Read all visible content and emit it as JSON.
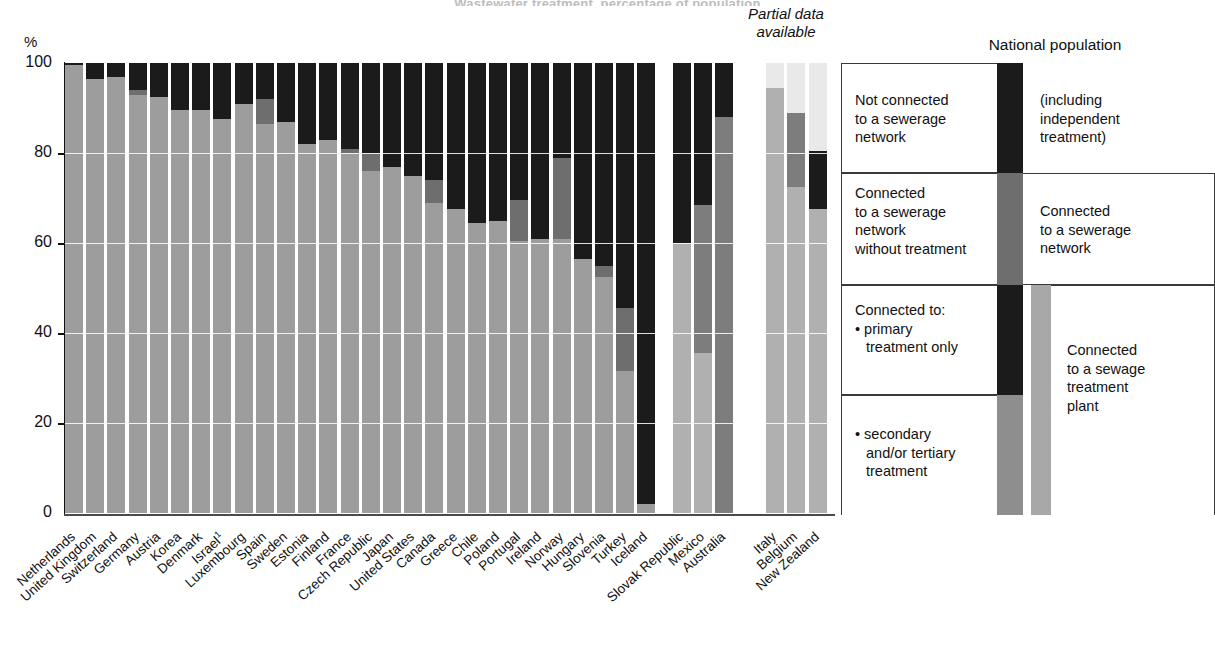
{
  "title": "Wastewater treatment, percentage of population",
  "axis": {
    "y_unit": "%",
    "y_ticks": [
      "100",
      "80",
      "60",
      "40",
      "20",
      "0"
    ],
    "ylim": [
      0,
      100
    ]
  },
  "annotations": {
    "partial_data": "Partial data\navailable",
    "partial_data_line1": "Partial data",
    "partial_data_line2": "available",
    "national_population": "National population"
  },
  "legend": {
    "not_connected": "Not connected\nto a sewerage\nnetwork",
    "not_connected_l1": "Not connected",
    "not_connected_l2": "to a sewerage",
    "not_connected_l3": "network",
    "including_independent": "(including\nindependent\ntreatment)",
    "including_l1": "(including",
    "including_l2": "independent",
    "including_l3": "treatment)",
    "connected_no_treatment_l1": "Connected",
    "connected_no_treatment_l2": "to a sewerage",
    "connected_no_treatment_l3": "network",
    "connected_no_treatment_l4": "without treatment",
    "connected_sewerage_l1": "Connected",
    "connected_sewerage_l2": "to a sewerage",
    "connected_sewerage_l3": "network",
    "connected_to_l1": "Connected to:",
    "primary_l1": "• primary",
    "primary_l2": "treatment only",
    "secondary_l1": "• secondary",
    "secondary_l2": "and/or tertiary",
    "secondary_l3": "treatment",
    "sewage_plant_l1": "Connected",
    "sewage_plant_l2": "to a sewage",
    "sewage_plant_l3": "treatment",
    "sewage_plant_l4": "plant"
  },
  "colors": {
    "secondary_tertiary": "#9d9d9d",
    "primary_only": "#6e6e6e",
    "no_treatment": "#1b1b1b",
    "not_connected": "#1b1b1b",
    "partial_unknown": "#e9e9e9",
    "background": "#ffffff",
    "axis": "#111111"
  },
  "chart_data": {
    "type": "bar",
    "stacked": true,
    "title": "Wastewater treatment, percentage of population",
    "xlabel": "",
    "ylabel": "%",
    "ylim": [
      0,
      100
    ],
    "grid": true,
    "legend_position": "right",
    "series": [
      {
        "name": "secondary and/or tertiary treatment",
        "color": "#9d9d9d"
      },
      {
        "name": "primary treatment only",
        "color": "#6e6e6e"
      },
      {
        "name": "connected to a sewerage network without treatment",
        "color": "#1b1b1b"
      },
      {
        "name": "not connected to a sewerage network",
        "color": "#1b1b1b"
      },
      {
        "name": "no data (partial)",
        "color": "#e9e9e9"
      }
    ],
    "categories": [
      "Netherlands",
      "United Kingdom",
      "Switzerland",
      "Germany",
      "Austria",
      "Korea",
      "Denmark",
      "Israel",
      "Luxembourg",
      "Spain",
      "Sweden",
      "Estonia",
      "Finland",
      "France",
      "Czech Republic",
      "Japan",
      "United States",
      "Canada",
      "Greece",
      "Chile",
      "Poland",
      "Portugal",
      "Ireland",
      "Norway",
      "Hungary",
      "Slovenia",
      "Turkey",
      "Iceland",
      "Slovak Republic",
      "Mexico",
      "Australia",
      "Italy",
      "Belgium",
      "New Zealand"
    ],
    "partial_data_categories": [
      "Slovak Republic",
      "Mexico",
      "Australia",
      "Italy",
      "Belgium",
      "New Zealand"
    ],
    "bars": [
      {
        "label": "Netherlands",
        "partial": false,
        "secondary": 99.5,
        "primary": 0,
        "no_treatment": 0.5,
        "not_connected": 0,
        "unknown": 0
      },
      {
        "label": "United Kingdom",
        "partial": false,
        "secondary": 96.5,
        "primary": 0,
        "no_treatment": 0,
        "not_connected": 3.5,
        "unknown": 0
      },
      {
        "label": "Switzerland",
        "partial": false,
        "secondary": 97,
        "primary": 0,
        "no_treatment": 0,
        "not_connected": 3,
        "unknown": 0
      },
      {
        "label": "Germany",
        "partial": false,
        "secondary": 93,
        "primary": 1,
        "no_treatment": 0,
        "not_connected": 6,
        "unknown": 0
      },
      {
        "label": "Austria",
        "partial": false,
        "secondary": 92.5,
        "primary": 0,
        "no_treatment": 0,
        "not_connected": 7.5,
        "unknown": 0
      },
      {
        "label": "Korea",
        "partial": false,
        "secondary": 89.5,
        "primary": 0,
        "no_treatment": 0,
        "not_connected": 10.5,
        "unknown": 0
      },
      {
        "label": "Denmark",
        "partial": false,
        "secondary": 89.5,
        "primary": 0,
        "no_treatment": 0,
        "not_connected": 10.5,
        "unknown": 0
      },
      {
        "label": "Israel",
        "partial": false,
        "secondary": 87.5,
        "primary": 0,
        "no_treatment": 5.5,
        "not_connected": 7,
        "unknown": 0
      },
      {
        "label": "Luxembourg",
        "partial": false,
        "secondary": 91,
        "primary": 0,
        "no_treatment": 0,
        "not_connected": 9,
        "unknown": 0
      },
      {
        "label": "Spain",
        "partial": false,
        "secondary": 86.5,
        "primary": 5.5,
        "no_treatment": 0,
        "not_connected": 8,
        "unknown": 0
      },
      {
        "label": "Sweden",
        "partial": false,
        "secondary": 87,
        "primary": 0,
        "no_treatment": 0,
        "not_connected": 13,
        "unknown": 0
      },
      {
        "label": "Estonia",
        "partial": false,
        "secondary": 82,
        "primary": 0,
        "no_treatment": 0,
        "not_connected": 18,
        "unknown": 0
      },
      {
        "label": "Finland",
        "partial": false,
        "secondary": 83,
        "primary": 0,
        "no_treatment": 0,
        "not_connected": 17,
        "unknown": 0
      },
      {
        "label": "France",
        "partial": false,
        "secondary": 80,
        "primary": 1,
        "no_treatment": 1,
        "not_connected": 18,
        "unknown": 0
      },
      {
        "label": "Czech Republic",
        "partial": false,
        "secondary": 76,
        "primary": 4,
        "no_treatment": 0,
        "not_connected": 20,
        "unknown": 0
      },
      {
        "label": "Japan",
        "partial": false,
        "secondary": 77,
        "primary": 0,
        "no_treatment": 0,
        "not_connected": 23,
        "unknown": 0
      },
      {
        "label": "United States",
        "partial": false,
        "secondary": 75,
        "primary": 0,
        "no_treatment": 0,
        "not_connected": 25,
        "unknown": 0
      },
      {
        "label": "Canada",
        "partial": false,
        "secondary": 69,
        "primary": 5,
        "no_treatment": 2,
        "not_connected": 24,
        "unknown": 0
      },
      {
        "label": "Greece",
        "partial": false,
        "secondary": 67.5,
        "primary": 0,
        "no_treatment": 0,
        "not_connected": 32.5,
        "unknown": 0
      },
      {
        "label": "Chile",
        "partial": false,
        "secondary": 64.5,
        "primary": 0,
        "no_treatment": 19,
        "not_connected": 16.5,
        "unknown": 0
      },
      {
        "label": "Poland",
        "partial": false,
        "secondary": 65,
        "primary": 0,
        "no_treatment": 0,
        "not_connected": 35,
        "unknown": 0
      },
      {
        "label": "Portugal",
        "partial": false,
        "secondary": 60.5,
        "primary": 9,
        "no_treatment": 1.5,
        "not_connected": 29,
        "unknown": 0
      },
      {
        "label": "Ireland",
        "partial": false,
        "secondary": 61,
        "primary": 0,
        "no_treatment": 13,
        "not_connected": 26,
        "unknown": 0
      },
      {
        "label": "Norway",
        "partial": false,
        "secondary": 61,
        "primary": 18,
        "no_treatment": 0,
        "not_connected": 21,
        "unknown": 0
      },
      {
        "label": "Hungary",
        "partial": false,
        "secondary": 56.5,
        "primary": 0,
        "no_treatment": 15,
        "not_connected": 28.5,
        "unknown": 0
      },
      {
        "label": "Slovenia",
        "partial": false,
        "secondary": 52.5,
        "primary": 2.5,
        "no_treatment": 11,
        "not_connected": 34,
        "unknown": 0
      },
      {
        "label": "Turkey",
        "partial": false,
        "secondary": 31.5,
        "primary": 14,
        "no_treatment": 0,
        "not_connected": 54.5,
        "unknown": 0
      },
      {
        "label": "Iceland",
        "partial": false,
        "secondary": 2,
        "primary": 0,
        "no_treatment": 55,
        "not_connected": 43,
        "unknown": 0
      },
      {
        "label": "Slovak Republic",
        "partial": true,
        "secondary": 60,
        "primary": 0,
        "no_treatment": 0,
        "not_connected": 40,
        "unknown": 0
      },
      {
        "label": "Mexico",
        "partial": true,
        "secondary": 35.5,
        "primary": 33,
        "no_treatment": 0,
        "not_connected": 31.5,
        "unknown": 0
      },
      {
        "label": "Australia",
        "partial": true,
        "secondary": 0,
        "primary": 88,
        "no_treatment": 0,
        "not_connected": 12,
        "unknown": 0
      },
      {
        "label": "Italy",
        "partial": true,
        "secondary": 94.5,
        "primary": 0,
        "no_treatment": 0,
        "not_connected": 0,
        "unknown": 0
      },
      {
        "label": "Belgium",
        "partial": true,
        "secondary": 72.5,
        "primary": 16.5,
        "no_treatment": 0,
        "not_connected": 0,
        "unknown": 0
      },
      {
        "label": "New Zealand",
        "partial": true,
        "secondary": 67.5,
        "primary": 0,
        "no_treatment": 13,
        "not_connected": 0,
        "unknown": 0
      }
    ]
  }
}
